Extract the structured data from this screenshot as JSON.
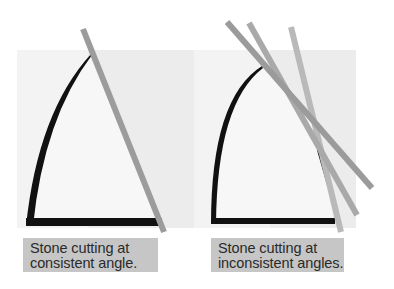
{
  "panels": [
    {
      "id": "consistent",
      "caption": {
        "line1": "Stone cutting at",
        "line2": "consistent angle."
      },
      "cut_lines": 1
    },
    {
      "id": "inconsistent",
      "caption": {
        "line1": "Stone cutting at",
        "line2": "inconsistent angles."
      },
      "cut_lines": 3
    }
  ],
  "colors": {
    "background": "#ffffff",
    "panel_bg": "#f2f2f2",
    "panel_bg_shade": "#ebebeb",
    "stone_outline": "#111111",
    "cut_line_dark": "#9a9a9a",
    "cut_line_mid": "#a8a8a8",
    "cut_line_light": "#b8b8b8",
    "caption_bg": "#c6c6c6"
  }
}
